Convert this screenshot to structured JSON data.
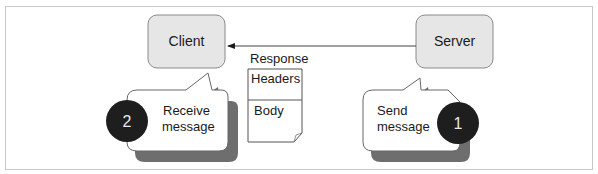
{
  "diagram": {
    "nodes": {
      "client": {
        "label": "Client"
      },
      "server": {
        "label": "Server"
      }
    },
    "arrow": {
      "from": "Server",
      "to": "Client"
    },
    "response": {
      "title": "Response",
      "sections": [
        "Headers",
        "Body"
      ]
    },
    "callouts": [
      {
        "number": "1",
        "line1": "Send",
        "line2": "message"
      },
      {
        "number": "2",
        "line1": "Receive",
        "line2": "message"
      }
    ],
    "colors": {
      "node_fill": "#e6e6e6",
      "node_stroke": "#8a8a8a",
      "badge_fill": "#1e1e1e",
      "shadow": "#6e6e6e"
    }
  }
}
